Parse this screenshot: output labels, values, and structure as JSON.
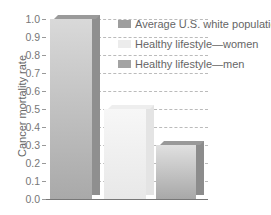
{
  "chart_data": {
    "type": "bar",
    "title": "",
    "xlabel": "",
    "ylabel": "Cancer mortality rate",
    "ylim": [
      0.0,
      1.0
    ],
    "yticks": [
      "0.0",
      "0.1",
      "0.2",
      "0.3",
      "0.4",
      "0.5",
      "0.6",
      "0.7",
      "0.8",
      "0.9",
      "1.0"
    ],
    "categories": [
      "Average U.S. white population",
      "Healthy lifestyle—women",
      "Healthy lifestyle—men"
    ],
    "values": [
      1.0,
      0.5,
      0.3
    ],
    "grid": "dashed horizontal",
    "legend_position": "upper right",
    "legend": [
      {
        "label": "Average U.S. white population",
        "color": "#9e9e9e"
      },
      {
        "label": "Healthy lifestyle—women",
        "color": "#ececec"
      },
      {
        "label": "Healthy lifestyle—men",
        "color": "#a3a3a3"
      }
    ]
  },
  "colors": {
    "bar1_face": "#b5b5b5",
    "bar1_side": "#8f8f8f",
    "bar2_face": "#efefef",
    "bar3_face": "#b8b8b8",
    "bar3_side": "#8c8c8c"
  }
}
